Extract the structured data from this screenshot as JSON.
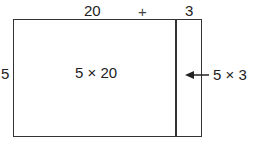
{
  "top_labels": {
    "left_length": "20",
    "plus": "+",
    "right_length": "3"
  },
  "side_label": "5",
  "regions": {
    "large": "5 × 20",
    "small": "5 × 3"
  },
  "arrow": {
    "direction": "left",
    "points_to": "small region"
  }
}
